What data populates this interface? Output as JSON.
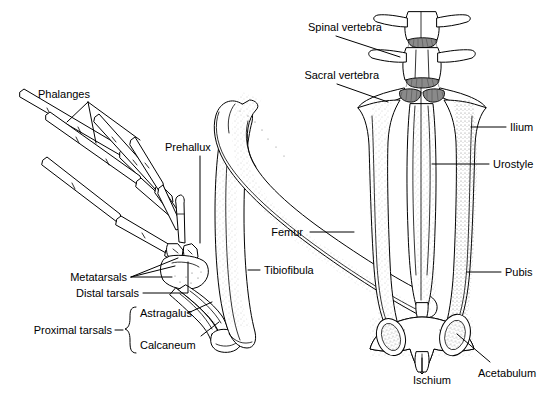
{
  "figure": {
    "background_color": "#ffffff",
    "line_color": "#000000",
    "stipple_color": "#6b6b6b",
    "cartilage_color": "#8a8a8a"
  },
  "labels": {
    "phalanges": "Phalanges",
    "prehallux": "Prehallux",
    "metatarsals": "Metatarsals",
    "distal_tarsals": "Distal tarsals",
    "proximal_tarsals": "Proximal tarsals",
    "astragalus": "Astragalus",
    "calcaneum": "Calcaneum",
    "femur": "Femur",
    "tibiofibula": "Tibiofibula",
    "spinal_vertebra": "Spinal vertebra",
    "sacral_vertebra": "Sacral vertebra",
    "ilium": "Ilium",
    "urostyle": "Urostyle",
    "pubis": "Pubis",
    "acetabulum": "Acetabulum",
    "ischium": "Ischium"
  },
  "structures": [
    {
      "name": "phalanges",
      "label": "Phalanges",
      "side": "left",
      "group": "foot"
    },
    {
      "name": "prehallux",
      "label": "Prehallux",
      "side": "left",
      "group": "foot"
    },
    {
      "name": "metatarsals",
      "label": "Metatarsals",
      "side": "left",
      "group": "foot"
    },
    {
      "name": "distal-tarsals",
      "label": "Distal tarsals",
      "side": "left",
      "group": "foot"
    },
    {
      "name": "proximal-tarsals",
      "label": "Proximal tarsals",
      "side": "left",
      "group": "foot",
      "members": [
        "Astragalus",
        "Calcaneum"
      ]
    },
    {
      "name": "astragalus",
      "label": "Astragalus",
      "side": "left",
      "group": "proximal-tarsals"
    },
    {
      "name": "calcaneum",
      "label": "Calcaneum",
      "side": "left",
      "group": "proximal-tarsals"
    },
    {
      "name": "femur",
      "label": "Femur",
      "side": "middle",
      "group": "limb"
    },
    {
      "name": "tibiofibula",
      "label": "Tibiofibula",
      "side": "middle",
      "group": "limb"
    },
    {
      "name": "spinal-vertebra",
      "label": "Spinal vertebra",
      "side": "right",
      "group": "axial"
    },
    {
      "name": "sacral-vertebra",
      "label": "Sacral vertebra",
      "side": "right",
      "group": "axial"
    },
    {
      "name": "ilium",
      "label": "Ilium",
      "side": "right",
      "group": "pelvis"
    },
    {
      "name": "urostyle",
      "label": "Urostyle",
      "side": "right",
      "group": "axial"
    },
    {
      "name": "pubis",
      "label": "Pubis",
      "side": "right",
      "group": "pelvis"
    },
    {
      "name": "acetabulum",
      "label": "Acetabulum",
      "side": "right",
      "group": "pelvis"
    },
    {
      "name": "ischium",
      "label": "Ischium",
      "side": "right",
      "group": "pelvis"
    }
  ]
}
